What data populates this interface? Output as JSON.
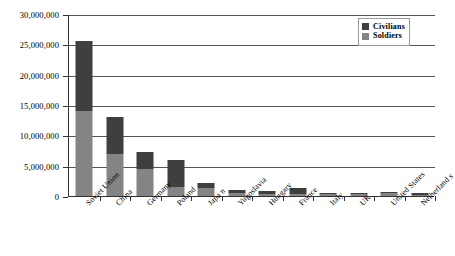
{
  "chart_data": {
    "type": "bar",
    "subtype": "stacked-vertical",
    "title": "",
    "xlabel": "",
    "ylabel": "",
    "ylim": [
      0,
      30000000
    ],
    "ytick_values": [
      0,
      5000000,
      10000000,
      15000000,
      20000000,
      25000000,
      30000000
    ],
    "ytick_labels": [
      "0",
      "5,000,000",
      "10,000,000",
      "15,000,000",
      "20,000,000",
      "25,000,000",
      "30,000,000"
    ],
    "grid": true,
    "grid_axis": "y",
    "legend_position": "top-right",
    "categories": [
      "Soviet Union",
      "China",
      "Germany",
      "Poland",
      "Japa n",
      "Yugoslavia",
      "Hungary",
      "France",
      "Italy",
      "UK",
      "United States",
      "Netherland s"
    ],
    "series": [
      {
        "name": "Soldiers",
        "color": "#848484",
        "values": [
          14000000,
          7000000,
          4400000,
          1500000,
          1300000,
          450000,
          300000,
          250000,
          300000,
          400000,
          420000,
          200000
        ]
      },
      {
        "name": "Civilians",
        "color": "#3f3f3f",
        "values": [
          11600000,
          6000000,
          2900000,
          4500000,
          800000,
          550000,
          500000,
          1150000,
          200000,
          100000,
          50000,
          300000
        ]
      }
    ],
    "totals": [
      25600000,
      13000000,
      7300000,
      6000000,
      2100000,
      1000000,
      800000,
      1400000,
      500000,
      500000,
      470000,
      500000
    ]
  },
  "legend": {
    "entries": [
      {
        "label": "Civilians",
        "color": "#3f3f3f",
        "swatch_name": "legend-swatch-civilians"
      },
      {
        "label": "Soldiers",
        "color": "#848484",
        "swatch_name": "legend-swatch-soldiers"
      }
    ]
  },
  "colors": {
    "civilians": "#3f3f3f",
    "soldiers": "#848484",
    "axis": "#333333",
    "gridline": "#555555",
    "background": "#ffffff"
  }
}
